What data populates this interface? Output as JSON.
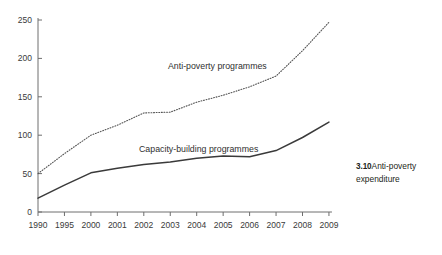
{
  "caption": {
    "number": "3.10",
    "text": "Anti-poverty expenditure"
  },
  "chart_data": {
    "type": "line",
    "title": "",
    "subtitle": "",
    "xlabel": "",
    "ylabel": "",
    "categories": [
      "1990",
      "1995",
      "2000",
      "2001",
      "2002",
      "2003",
      "2004",
      "2005",
      "2006",
      "2007",
      "2008",
      "2009"
    ],
    "ylim": [
      0,
      250
    ],
    "yticks": [
      0,
      50,
      100,
      150,
      200,
      250
    ],
    "ytick_labels": [
      "0",
      "50",
      "100",
      "150",
      "200",
      "250"
    ],
    "grid": false,
    "legend_position": "inline-annotation",
    "series": [
      {
        "name": "Anti-poverty programmes",
        "style": "dotted",
        "color": "#555555",
        "values": [
          50,
          76,
          100,
          113,
          129,
          130,
          143,
          152,
          163,
          177,
          210,
          247
        ]
      },
      {
        "name": "Capacity-building programmes",
        "style": "solid",
        "color": "#3a3a3a",
        "values": [
          18,
          35,
          51,
          57,
          62,
          65,
          70,
          73,
          72,
          80,
          97,
          117
        ]
      }
    ],
    "annotations": [
      {
        "text": "Anti-poverty programmes",
        "series": "Anti-poverty programmes"
      },
      {
        "text": "Capacity-building programmes",
        "series": "Capacity-building programmes"
      }
    ]
  },
  "axis": {
    "x_color": "#6e6e6e",
    "y_color": "#6e6e6e"
  }
}
